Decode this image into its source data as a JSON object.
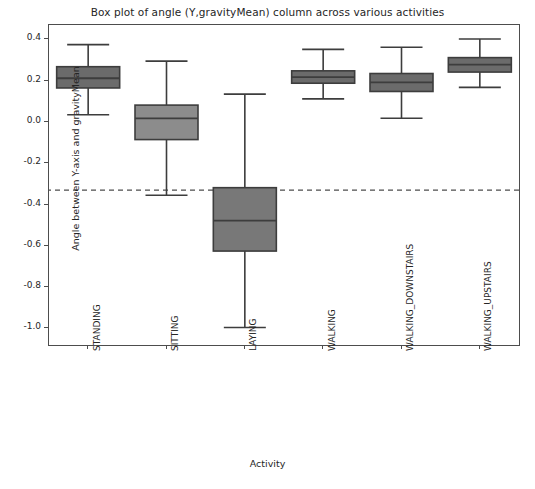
{
  "chart_data": {
    "type": "box",
    "title": "Box plot of angle (Y,gravityMean) column across various activities",
    "xlabel": "Activity",
    "ylabel": "Angle between Y-axis and gravityMean",
    "categories": [
      "STANDING",
      "SITTING",
      "LAYING",
      "WALKING",
      "WALKING_DOWNSTAIRS",
      "WALKING_UPSTAIRS"
    ],
    "ylim": [
      -1.08,
      0.47
    ],
    "yticks": [
      0.4,
      0.2,
      0.0,
      -0.2,
      -0.4,
      -0.6,
      -0.8,
      -1.0
    ],
    "ytick_labels": [
      "0.4",
      "0.2",
      "0.0",
      "-0.2",
      "-0.4",
      "-0.6",
      "-0.8",
      "-1.0"
    ],
    "grid": false,
    "legend": false,
    "box_fill_color": "#6b6b6b",
    "box_fill_color_light": "#8c8c8c",
    "box_edge_color": "#3d3d3d",
    "reference_line": {
      "value": -0.33,
      "style": "dashed",
      "color": "#4d4d4d"
    },
    "boxes": [
      {
        "category": "STANDING",
        "whisker_low": 0.035,
        "q1": 0.165,
        "median": 0.212,
        "q3": 0.268,
        "whisker_high": 0.375,
        "fill": "#6b6b6b"
      },
      {
        "category": "SITTING",
        "whisker_low": -0.355,
        "q1": -0.085,
        "median": 0.018,
        "q3": 0.082,
        "whisker_high": 0.295,
        "fill": "#8c8c8c"
      },
      {
        "category": "LAYING",
        "whisker_low": -0.995,
        "q1": -0.625,
        "median": -0.478,
        "q3": -0.318,
        "whisker_high": 0.135,
        "fill": "#787878"
      },
      {
        "category": "WALKING",
        "whisker_low": 0.112,
        "q1": 0.188,
        "median": 0.218,
        "q3": 0.248,
        "whisker_high": 0.352,
        "fill": "#6b6b6b"
      },
      {
        "category": "WALKING_DOWNSTAIRS",
        "whisker_low": 0.018,
        "q1": 0.148,
        "median": 0.192,
        "q3": 0.235,
        "whisker_high": 0.362,
        "fill": "#6b6b6b"
      },
      {
        "category": "WALKING_UPSTAIRS",
        "whisker_low": 0.168,
        "q1": 0.242,
        "median": 0.278,
        "q3": 0.312,
        "whisker_high": 0.402,
        "fill": "#6b6b6b"
      }
    ]
  }
}
